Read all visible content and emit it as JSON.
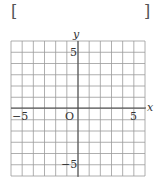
{
  "answer_box": {
    "left": "[",
    "right": "]"
  },
  "chart_data": {
    "type": "scatter",
    "title": "",
    "xlabel": "x",
    "ylabel": "y",
    "xlim": [
      -6,
      6
    ],
    "ylim": [
      -6,
      6
    ],
    "grid": true,
    "grid_step": 1,
    "x_ticks_labeled": [
      -5,
      5
    ],
    "y_ticks_labeled": [
      5,
      -5
    ],
    "origin_label": "O",
    "series": [],
    "colors": {
      "grid": "#9a9a9a",
      "axis": "#444444",
      "text": "#333333"
    }
  },
  "labels": {
    "x_axis": "x",
    "y_axis": "y",
    "origin": "O",
    "x_neg5": "−5",
    "x_pos5": "5",
    "y_pos5": "5",
    "y_neg5": "−5"
  }
}
